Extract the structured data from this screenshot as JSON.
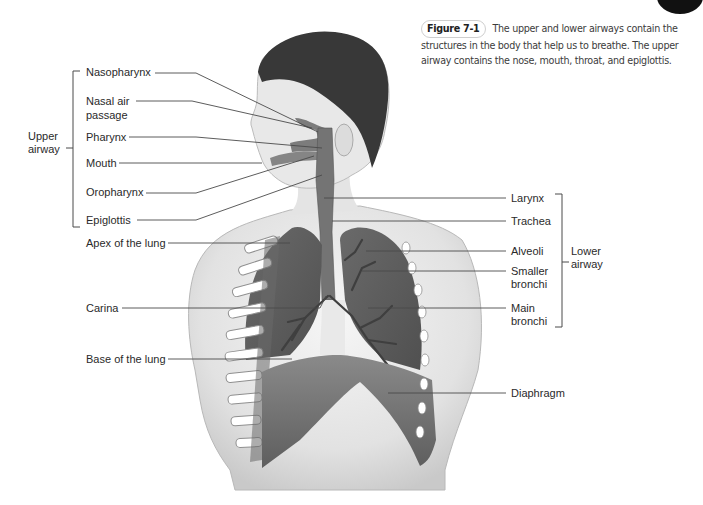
{
  "caption": {
    "figure_label": "Figure 7-1",
    "text": "The upper and lower airways contain the structures in the body that help us to breathe. The upper airway contains the nose, mouth, throat, and epiglottis."
  },
  "groups": {
    "upper": [
      "Upper",
      "airway"
    ],
    "lower": [
      "Lower",
      "airway"
    ]
  },
  "labels_left": [
    {
      "text": "Nasopharynx"
    },
    {
      "text": "Nasal air"
    },
    {
      "text": "passage"
    },
    {
      "text": "Pharynx"
    },
    {
      "text": "Mouth"
    },
    {
      "text": "Oropharynx"
    },
    {
      "text": "Epiglottis"
    },
    {
      "text": "Apex of the lung"
    },
    {
      "text": "Carina"
    },
    {
      "text": "Base of the lung"
    }
  ],
  "labels_right": [
    {
      "text": "Larynx"
    },
    {
      "text": "Trachea"
    },
    {
      "text": "Alveoli"
    },
    {
      "text": "Smaller"
    },
    {
      "text": "bronchi"
    },
    {
      "text": "Main"
    },
    {
      "text": "bronchi"
    },
    {
      "text": "Diaphragm"
    }
  ],
  "colors": {
    "line": "#4a4a4a",
    "skin": "#e6e6e6",
    "hair": "#3a3a3a",
    "lung": "#6e6e6e",
    "airway": "#7a7a7a"
  }
}
